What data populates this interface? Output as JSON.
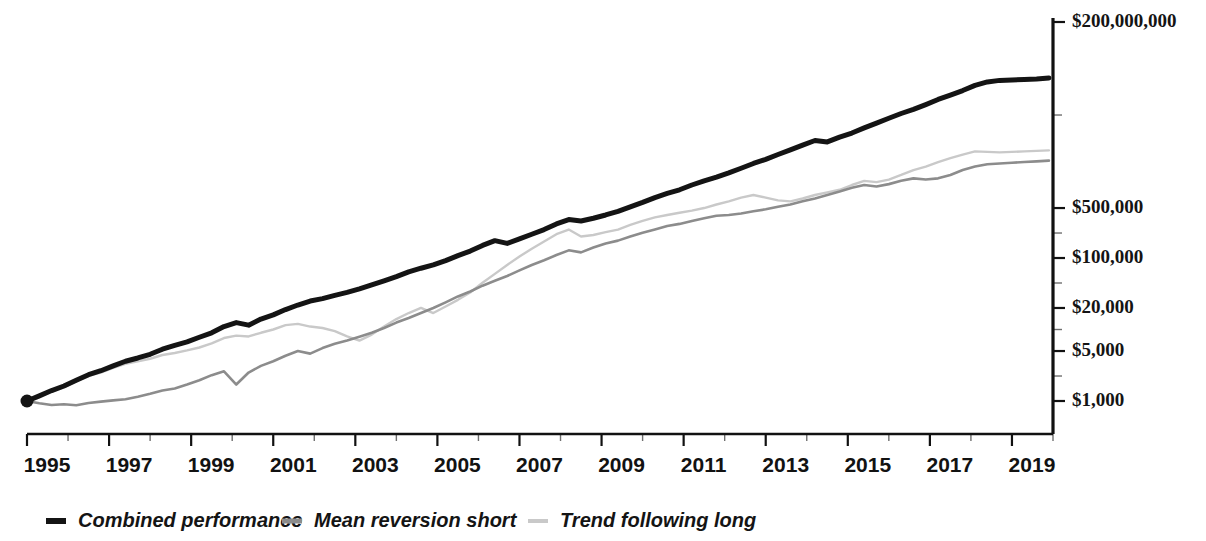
{
  "chart_data": {
    "type": "line",
    "title": "",
    "subtitle": "",
    "xlabel": "",
    "ylabel": "",
    "yscale": "log",
    "ylim": [
      1000,
      200000000
    ],
    "xlim": [
      1995,
      2020
    ],
    "grid": false,
    "legend_position": "bottom-left",
    "y_tick_labels": [
      "$200,000,000",
      "$500,000",
      "$100,000",
      "$20,000",
      "$5,000",
      "$1,000"
    ],
    "y_tick_values": [
      200000000,
      500000,
      100000,
      20000,
      5000,
      1000
    ],
    "x_tick_labels": [
      "1995",
      "1997",
      "1999",
      "2001",
      "2003",
      "2005",
      "2007",
      "2009",
      "2011",
      "2013",
      "2015",
      "2017",
      "2019"
    ],
    "x_tick_values": [
      1995,
      1997,
      1999,
      2001,
      2003,
      2005,
      2007,
      2009,
      2011,
      2013,
      2015,
      2017,
      2019
    ],
    "x_minor_ticks": [
      1996,
      1998,
      2000,
      2002,
      2004,
      2006,
      2008,
      2010,
      2012,
      2014,
      2016,
      2018,
      2020
    ],
    "colors": {
      "combined_performance": "#141414",
      "mean_reversion_short": "#8c8c8c",
      "trend_following_long": "#c9c9c9"
    },
    "series": [
      {
        "name": "Combined performance",
        "color": "#141414",
        "width": 5.0,
        "marker_start": true,
        "x": [
          1995.0,
          1995.3,
          1995.6,
          1995.9,
          1996.2,
          1996.5,
          1996.8,
          1997.1,
          1997.4,
          1997.7,
          1998.0,
          1998.3,
          1998.6,
          1998.9,
          1999.2,
          1999.5,
          1999.8,
          2000.1,
          2000.4,
          2000.7,
          2001.0,
          2001.3,
          2001.6,
          2001.9,
          2002.2,
          2002.5,
          2002.8,
          2003.1,
          2003.4,
          2003.7,
          2004.0,
          2004.3,
          2004.6,
          2004.9,
          2005.2,
          2005.5,
          2005.8,
          2006.1,
          2006.4,
          2006.7,
          2007.0,
          2007.3,
          2007.6,
          2007.9,
          2008.2,
          2008.5,
          2008.8,
          2009.1,
          2009.4,
          2009.7,
          2010.0,
          2010.3,
          2010.6,
          2010.9,
          2011.2,
          2011.5,
          2011.8,
          2012.1,
          2012.4,
          2012.7,
          2013.0,
          2013.3,
          2013.6,
          2013.9,
          2014.2,
          2014.5,
          2014.8,
          2015.1,
          2015.4,
          2015.7,
          2016.0,
          2016.3,
          2016.6,
          2016.9,
          2017.2,
          2017.5,
          2017.8,
          2018.1,
          2018.4,
          2018.7,
          2019.0,
          2019.3,
          2019.6,
          2019.9
        ],
        "y": [
          1000,
          1180,
          1400,
          1620,
          1950,
          2330,
          2650,
          3100,
          3600,
          4000,
          4500,
          5300,
          6000,
          6700,
          7800,
          9000,
          11000,
          12500,
          11500,
          14000,
          16000,
          19000,
          22000,
          25000,
          27000,
          30000,
          33000,
          37000,
          42000,
          48000,
          55000,
          64000,
          72000,
          80000,
          92000,
          108000,
          125000,
          150000,
          175000,
          160000,
          185000,
          215000,
          250000,
          300000,
          345000,
          330000,
          360000,
          400000,
          450000,
          520000,
          600000,
          700000,
          800000,
          900000,
          1050000,
          1200000,
          1350000,
          1550000,
          1800000,
          2100000,
          2400000,
          2800000,
          3250000,
          3800000,
          4400000,
          4200000,
          4900000,
          5600000,
          6600000,
          7700000,
          9000000,
          10500000,
          12000000,
          14000000,
          16500000,
          19000000,
          22000000,
          26000000,
          29000000,
          30500000,
          31000000,
          31500000,
          32000000,
          33000000
        ]
      },
      {
        "name": "Mean reversion short",
        "color": "#8c8c8c",
        "width": 2.6,
        "marker_start": false,
        "x": [
          1995.0,
          1995.3,
          1995.6,
          1995.9,
          1996.2,
          1996.5,
          1996.8,
          1997.1,
          1997.4,
          1997.7,
          1998.0,
          1998.3,
          1998.6,
          1998.9,
          1999.2,
          1999.5,
          1999.8,
          2000.1,
          2000.4,
          2000.7,
          2001.0,
          2001.3,
          2001.6,
          2001.9,
          2002.2,
          2002.5,
          2002.8,
          2003.1,
          2003.4,
          2003.7,
          2004.0,
          2004.3,
          2004.6,
          2004.9,
          2005.2,
          2005.5,
          2005.8,
          2006.1,
          2006.4,
          2006.7,
          2007.0,
          2007.3,
          2007.6,
          2007.9,
          2008.2,
          2008.5,
          2008.8,
          2009.1,
          2009.4,
          2009.7,
          2010.0,
          2010.3,
          2010.6,
          2010.9,
          2011.2,
          2011.5,
          2011.8,
          2012.1,
          2012.4,
          2012.7,
          2013.0,
          2013.3,
          2013.6,
          2013.9,
          2014.2,
          2014.5,
          2014.8,
          2015.1,
          2015.4,
          2015.7,
          2016.0,
          2016.3,
          2016.6,
          2016.9,
          2017.2,
          2017.5,
          2017.8,
          2018.1,
          2018.4,
          2018.7,
          2019.0,
          2019.3,
          2019.6,
          2019.9
        ],
        "y": [
          1000,
          930,
          880,
          900,
          870,
          940,
          980,
          1020,
          1060,
          1150,
          1260,
          1400,
          1500,
          1700,
          1950,
          2300,
          2600,
          1700,
          2500,
          3100,
          3600,
          4300,
          5000,
          4600,
          5500,
          6300,
          7000,
          7900,
          9000,
          10500,
          12500,
          14500,
          17000,
          20000,
          24000,
          29000,
          34000,
          41000,
          48000,
          56000,
          67000,
          80000,
          93000,
          110000,
          128000,
          120000,
          140000,
          160000,
          175000,
          200000,
          225000,
          250000,
          280000,
          300000,
          330000,
          360000,
          390000,
          400000,
          420000,
          450000,
          480000,
          520000,
          560000,
          620000,
          680000,
          760000,
          850000,
          960000,
          1050000,
          1000000,
          1080000,
          1200000,
          1300000,
          1250000,
          1300000,
          1450000,
          1700000,
          1900000,
          2050000,
          2100000,
          2150000,
          2200000,
          2250000,
          2300000
        ]
      },
      {
        "name": "Trend following long",
        "color": "#c9c9c9",
        "width": 2.4,
        "marker_start": false,
        "x": [
          1995.0,
          1995.3,
          1995.6,
          1995.9,
          1996.2,
          1996.5,
          1996.8,
          1997.1,
          1997.4,
          1997.7,
          1998.0,
          1998.3,
          1998.6,
          1998.9,
          1999.2,
          1999.5,
          1999.8,
          2000.1,
          2000.4,
          2000.7,
          2001.0,
          2001.3,
          2001.6,
          2001.9,
          2002.2,
          2002.5,
          2002.8,
          2003.1,
          2003.4,
          2003.7,
          2004.0,
          2004.3,
          2004.6,
          2004.9,
          2005.2,
          2005.5,
          2005.8,
          2006.1,
          2006.4,
          2006.7,
          2007.0,
          2007.3,
          2007.6,
          2007.9,
          2008.2,
          2008.5,
          2008.8,
          2009.1,
          2009.4,
          2009.7,
          2010.0,
          2010.3,
          2010.6,
          2010.9,
          2011.2,
          2011.5,
          2011.8,
          2012.1,
          2012.4,
          2012.7,
          2013.0,
          2013.3,
          2013.6,
          2013.9,
          2014.2,
          2014.5,
          2014.8,
          2015.1,
          2015.4,
          2015.7,
          2016.0,
          2016.3,
          2016.6,
          2016.9,
          2017.2,
          2017.5,
          2017.8,
          2018.1,
          2018.4,
          2018.7,
          2019.0,
          2019.3,
          2019.6,
          2019.9
        ],
        "y": [
          1000,
          1150,
          1350,
          1550,
          1900,
          2250,
          2500,
          2900,
          3300,
          3600,
          3900,
          4400,
          4700,
          5100,
          5600,
          6400,
          7600,
          8200,
          8000,
          9000,
          10000,
          11500,
          12000,
          11000,
          10500,
          9500,
          8000,
          7000,
          8500,
          11000,
          14000,
          17000,
          20000,
          17000,
          21000,
          26000,
          33000,
          45000,
          60000,
          80000,
          105000,
          135000,
          170000,
          215000,
          250000,
          200000,
          210000,
          230000,
          250000,
          290000,
          330000,
          370000,
          400000,
          430000,
          460000,
          500000,
          560000,
          620000,
          700000,
          760000,
          700000,
          640000,
          620000,
          680000,
          760000,
          830000,
          900000,
          1050000,
          1200000,
          1150000,
          1250000,
          1450000,
          1700000,
          1900000,
          2200000,
          2500000,
          2800000,
          3100000,
          3050000,
          3000000,
          3050000,
          3100000,
          3150000,
          3200000
        ]
      }
    ]
  },
  "legend": {
    "items": [
      {
        "label": "Combined performance",
        "color": "#141414",
        "swatch": "thick-line-swatch"
      },
      {
        "label": "Mean reversion short",
        "color": "#8c8c8c",
        "swatch": "medium-line-swatch"
      },
      {
        "label": "Trend following long",
        "color": "#c9c9c9",
        "swatch": "light-line-swatch"
      }
    ]
  }
}
